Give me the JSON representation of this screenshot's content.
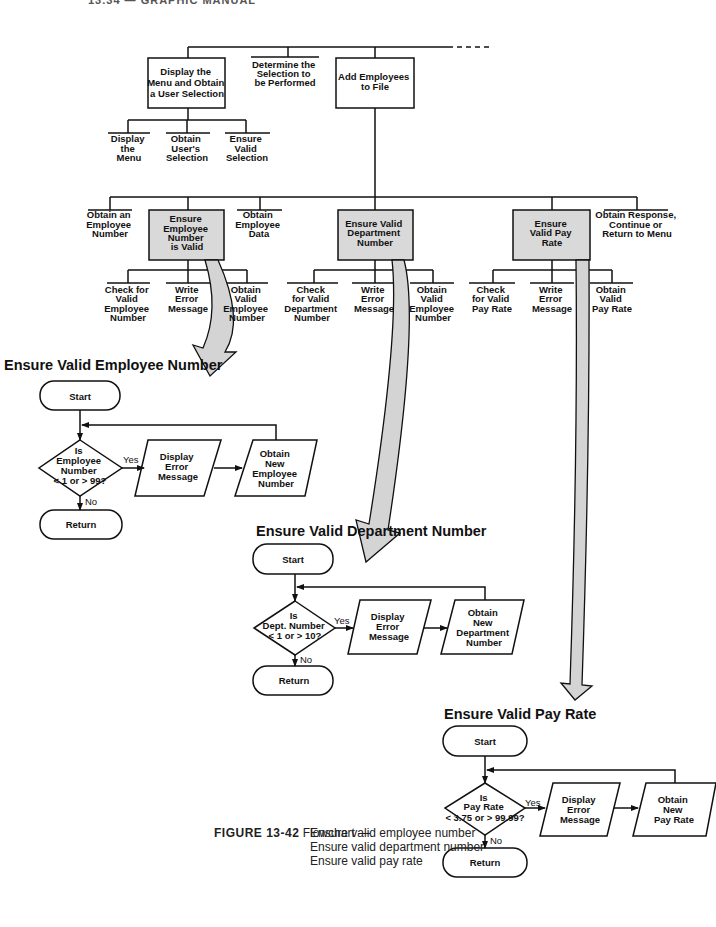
{
  "page_header": {
    "text": "13.34 — GRAPHIC MANUAL"
  },
  "hierarchy": {
    "level1": [
      {
        "id": "display-menu",
        "label": [
          "Display the",
          "Menu and Obtain",
          "a User Selection"
        ],
        "boxed": true,
        "shaded": false
      },
      {
        "id": "determine-selection",
        "label": [
          "Determine the",
          "Selection to",
          "be Performed"
        ],
        "boxed": false,
        "shaded": false
      },
      {
        "id": "add-employees",
        "label": [
          "Add Employees",
          "to File"
        ],
        "boxed": true,
        "shaded": false
      }
    ],
    "level1_continuation": "- - - -",
    "display_menu_children": [
      {
        "label": [
          "Display",
          "the",
          "Menu"
        ]
      },
      {
        "label": [
          "Obtain",
          "User's",
          "Selection"
        ]
      },
      {
        "label": [
          "Ensure",
          "Valid",
          "Selection"
        ]
      }
    ],
    "add_employees_children": [
      {
        "label": [
          "Obtain an",
          "Employee",
          "Number"
        ],
        "boxed": false
      },
      {
        "label": [
          "Ensure",
          "Employee",
          "Number",
          "is Valid"
        ],
        "boxed": true,
        "shaded": true
      },
      {
        "label": [
          "Obtain",
          "Employee",
          "Data"
        ],
        "boxed": false
      },
      {
        "label": [
          "Ensure Valid",
          "Department",
          "Number"
        ],
        "boxed": true,
        "shaded": true
      },
      {
        "label": [
          "Ensure",
          "Valid Pay",
          "Rate"
        ],
        "boxed": true,
        "shaded": true
      },
      {
        "label": [
          "Obtain Response,",
          "Continue or",
          "Return to Menu"
        ],
        "boxed": false
      }
    ],
    "employee_number_children": [
      {
        "label": [
          "Check for",
          "Valid",
          "Employee",
          "Number"
        ]
      },
      {
        "label": [
          "Write",
          "Error",
          "Message"
        ]
      },
      {
        "label": [
          "Obtain",
          "Valid",
          "Employee",
          "Number"
        ]
      }
    ],
    "department_number_children": [
      {
        "label": [
          "Check",
          "for Valid",
          "Department",
          "Number"
        ]
      },
      {
        "label": [
          "Write",
          "Error",
          "Message"
        ]
      },
      {
        "label": [
          "Obtain",
          "Valid",
          "Employee",
          "Number"
        ]
      }
    ],
    "pay_rate_children": [
      {
        "label": [
          "Check",
          "for Valid",
          "Pay Rate"
        ]
      },
      {
        "label": [
          "Write",
          "Error",
          "Message"
        ]
      },
      {
        "label": [
          "Obtain",
          "Valid",
          "Pay Rate"
        ]
      }
    ]
  },
  "flowcharts": [
    {
      "title": "Ensure Valid Employee Number",
      "start": "Start",
      "decision": [
        "Is",
        "Employee",
        "Number",
        "< 1 or > 99?"
      ],
      "yes": "Yes",
      "no": "No",
      "io1": [
        "Display",
        "Error",
        "Message"
      ],
      "io2": [
        "Obtain",
        "New",
        "Employee",
        "Number"
      ],
      "end": "Return"
    },
    {
      "title": "Ensure Valid Department Number",
      "start": "Start",
      "decision": [
        "Is",
        "Dept. Number",
        "< 1 or > 10?"
      ],
      "yes": "Yes",
      "no": "No",
      "io1": [
        "Display",
        "Error",
        "Message"
      ],
      "io2": [
        "Obtain",
        "New",
        "Department",
        "Number"
      ],
      "end": "Return"
    },
    {
      "title": "Ensure Valid Pay Rate",
      "start": "Start",
      "decision": [
        "Is",
        "Pay Rate",
        "< 3.75 or > 99.99?"
      ],
      "yes": "Yes",
      "no": "No",
      "io1": [
        "Display",
        "Error",
        "Message"
      ],
      "io2": [
        "Obtain",
        "New",
        "Pay Rate"
      ],
      "end": "Return"
    }
  ],
  "caption": {
    "figure": "FIGURE 13-42",
    "prefix": "Flowchart —",
    "lines": [
      "Ensure valid employee number",
      "Ensure valid department number",
      "Ensure valid pay rate"
    ]
  },
  "colors": {
    "line": "#111111",
    "shade": "#d9d9d9",
    "arrow_fill": "#d4d4d4"
  }
}
